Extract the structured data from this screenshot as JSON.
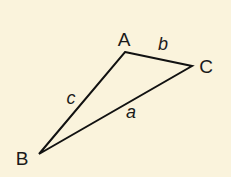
{
  "diagram": {
    "type": "triangle",
    "background": "#faf3dc",
    "stroke_color": "#111111",
    "vertices": {
      "A": {
        "label": "A",
        "x": 125,
        "y": 52,
        "label_x": 124,
        "label_y": 46
      },
      "B": {
        "label": "B",
        "x": 39,
        "y": 154,
        "label_x": 22,
        "label_y": 165
      },
      "C": {
        "label": "C",
        "x": 192,
        "y": 66,
        "label_x": 206,
        "label_y": 73
      }
    },
    "sides": {
      "a": {
        "label": "a",
        "between": [
          "B",
          "C"
        ],
        "label_x": 131,
        "label_y": 118
      },
      "b": {
        "label": "b",
        "between": [
          "A",
          "C"
        ],
        "label_x": 163,
        "label_y": 50
      },
      "c": {
        "label": "c",
        "between": [
          "A",
          "B"
        ],
        "label_x": 71,
        "label_y": 104
      }
    }
  }
}
